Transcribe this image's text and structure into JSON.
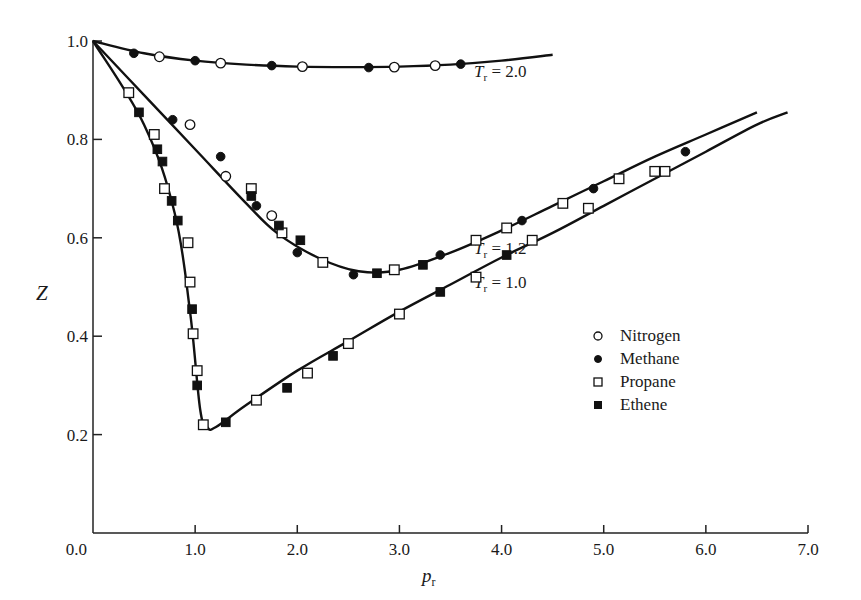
{
  "chart_data": {
    "type": "scatter",
    "title": "",
    "xlabel": "p_r",
    "ylabel": "Z",
    "xlim": [
      0.0,
      7.0
    ],
    "ylim": [
      0.0,
      1.0
    ],
    "grid": false,
    "legend_position": "inside-right-middle",
    "x_ticks": [
      "0.0",
      "1.0",
      "2.0",
      "3.0",
      "4.0",
      "5.0",
      "6.0",
      "7.0"
    ],
    "y_ticks": [
      "0.2",
      "0.4",
      "0.6",
      "0.8",
      "1.0"
    ],
    "legend": [
      {
        "name": "Nitrogen",
        "marker": "open-circle"
      },
      {
        "name": "Methane",
        "marker": "filled-circle"
      },
      {
        "name": "Propane",
        "marker": "open-square"
      },
      {
        "name": "Ethene",
        "marker": "filled-square"
      }
    ],
    "curves": [
      {
        "label": "Tr = 2.0",
        "label_parts": [
          "T",
          "r",
          " = 2.0"
        ],
        "x": [
          0.0,
          0.5,
          1.0,
          1.5,
          2.0,
          2.5,
          3.0,
          3.5,
          4.0,
          4.5
        ],
        "y": [
          1.0,
          0.975,
          0.96,
          0.952,
          0.948,
          0.947,
          0.948,
          0.952,
          0.96,
          0.972
        ]
      },
      {
        "label": "Tr = 1.2",
        "label_parts": [
          "T",
          "r",
          " = 1.2"
        ],
        "x": [
          0.0,
          0.5,
          1.0,
          1.5,
          1.8,
          2.2,
          2.6,
          3.0,
          3.5,
          4.0,
          4.5,
          5.0,
          5.5,
          6.0,
          6.5
        ],
        "y": [
          1.0,
          0.89,
          0.78,
          0.67,
          0.61,
          0.56,
          0.532,
          0.535,
          0.57,
          0.615,
          0.665,
          0.715,
          0.765,
          0.81,
          0.855
        ]
      },
      {
        "label": "Tr = 1.0",
        "label_parts": [
          "T",
          "r",
          " = 1.0"
        ],
        "x": [
          0.0,
          0.5,
          0.8,
          0.95,
          1.05,
          1.12,
          1.2,
          1.5,
          2.0,
          2.5,
          3.0,
          3.5,
          4.0,
          4.5,
          5.0,
          5.5,
          6.0,
          6.5,
          6.8
        ],
        "y": [
          1.0,
          0.83,
          0.65,
          0.45,
          0.25,
          0.215,
          0.215,
          0.26,
          0.33,
          0.39,
          0.45,
          0.505,
          0.56,
          0.61,
          0.665,
          0.72,
          0.775,
          0.83,
          0.855
        ]
      }
    ],
    "series": [
      {
        "name": "Nitrogen",
        "marker": "open-circle",
        "x": [
          0.65,
          1.25,
          2.05,
          2.95,
          3.35,
          0.95,
          1.3,
          1.75
        ],
        "y": [
          0.968,
          0.955,
          0.948,
          0.947,
          0.95,
          0.83,
          0.725,
          0.645
        ]
      },
      {
        "name": "Methane",
        "marker": "filled-circle",
        "x": [
          0.4,
          1.0,
          1.75,
          2.7,
          3.6,
          0.78,
          1.25,
          1.6,
          2.0,
          2.55,
          3.4,
          4.2,
          4.9,
          5.8
        ],
        "y": [
          0.975,
          0.96,
          0.95,
          0.946,
          0.953,
          0.84,
          0.765,
          0.665,
          0.57,
          0.525,
          0.565,
          0.635,
          0.7,
          0.775
        ]
      },
      {
        "name": "Propane",
        "marker": "open-square",
        "x": [
          0.35,
          0.6,
          0.7,
          0.93,
          0.95,
          0.98,
          1.02,
          1.08,
          1.6,
          2.1,
          2.5,
          3.0,
          3.75,
          4.3,
          4.85,
          5.5,
          1.55,
          1.85,
          2.25,
          2.95,
          3.75,
          4.05,
          4.6,
          5.15,
          5.6
        ],
        "y": [
          0.895,
          0.81,
          0.7,
          0.59,
          0.51,
          0.405,
          0.33,
          0.22,
          0.27,
          0.325,
          0.385,
          0.445,
          0.52,
          0.595,
          0.66,
          0.735,
          0.7,
          0.61,
          0.55,
          0.535,
          0.595,
          0.62,
          0.67,
          0.72,
          0.735
        ]
      },
      {
        "name": "Ethene",
        "marker": "filled-square",
        "x": [
          0.45,
          0.63,
          0.68,
          0.77,
          0.83,
          0.97,
          1.02,
          1.3,
          1.9,
          2.35,
          3.4,
          4.05,
          1.55,
          1.82,
          2.03,
          2.78,
          3.23
        ],
        "y": [
          0.855,
          0.78,
          0.755,
          0.675,
          0.635,
          0.455,
          0.3,
          0.225,
          0.295,
          0.36,
          0.49,
          0.565,
          0.685,
          0.625,
          0.595,
          0.528,
          0.545
        ]
      }
    ]
  },
  "axes": {
    "x_title_main": "p",
    "x_title_sub": "r",
    "y_title": "Z"
  }
}
